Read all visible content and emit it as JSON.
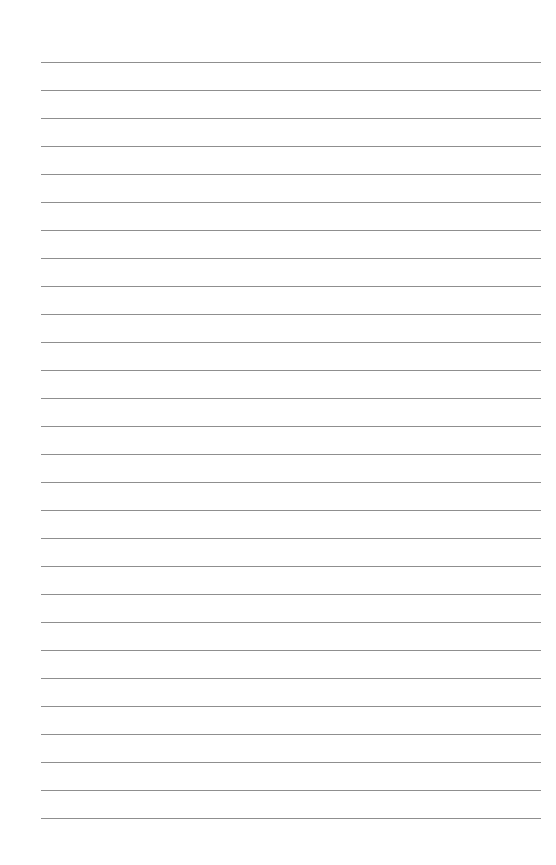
{
  "page": {
    "type": "lined-paper",
    "background_color": "#ffffff",
    "line_color": "#8f8f8f",
    "line_count": 28,
    "first_line_y": 62,
    "line_spacing": 28,
    "line_left": 41,
    "line_right": 541,
    "lines_text": [
      "",
      "",
      "",
      "",
      "",
      "",
      "",
      "",
      "",
      "",
      "",
      "",
      "",
      "",
      "",
      "",
      "",
      "",
      "",
      "",
      "",
      "",
      "",
      "",
      "",
      "",
      "",
      ""
    ]
  }
}
